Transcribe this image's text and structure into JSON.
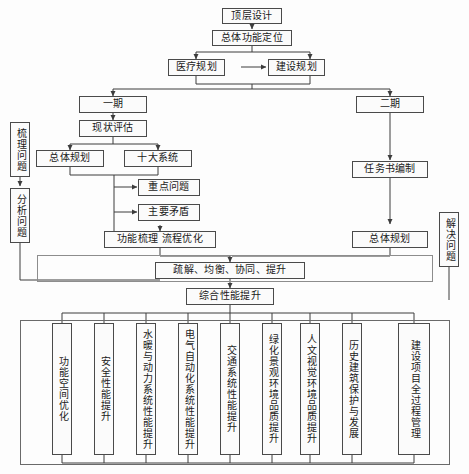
{
  "diagram": {
    "nodes": {
      "top_design": "顶层设计",
      "overall_function": "总体功能定位",
      "medical_plan": "医疗规划",
      "construction_plan": "建设规划",
      "phase_one": "一期",
      "phase_two": "二期",
      "status_eval": "现状评估",
      "overall_planning_left": "总体规划",
      "ten_systems": "十大系统",
      "key_issues": "重点问题",
      "main_contradiction": "主要矛盾",
      "function_process": "功能梳理  流程优化",
      "task_book": "任务书编制",
      "overall_planning_right": "总体规划",
      "principles": "疏解、均衡、协同、提升",
      "comprehensive": "综合性能提升"
    },
    "side_labels": {
      "sort_problem": "梳理问题",
      "analyze_problem": "分析问题",
      "solve_problem": "解决问题"
    },
    "bottom_items": [
      "功能空间优化",
      "安全性能提升",
      "水暖与动力系统性能提升",
      "电气自动化系统性能提升",
      "交通系统性能提升",
      "绿化景观环境品质提升",
      "人文视觉环境品质提升",
      "历史建筑保护与发展",
      "建设项目全过程管理"
    ]
  },
  "colors": {
    "stroke": "#4a4a4a",
    "frame": "#8d8d8d",
    "text": "#1a1a1a",
    "background": "#fdfdfd"
  }
}
